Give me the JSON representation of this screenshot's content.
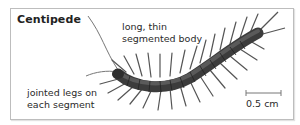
{
  "diagram": {
    "title": "Centipede",
    "labels": {
      "body": [
        "long, thin",
        "segmented body"
      ],
      "legs": [
        "jointed legs on",
        "each segment"
      ]
    },
    "scale_bar": "0.5 cm"
  }
}
